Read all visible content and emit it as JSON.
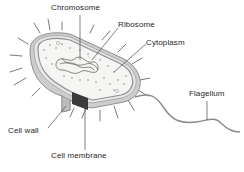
{
  "diagram": {
    "labels": {
      "chromosome": "Chromosome",
      "ribosome": "Ribosome",
      "cytoplasm": "Cytoplasm",
      "flagellum": "Flagellum",
      "cell_wall": "Cell wall",
      "cell_membrane": "Cell membrane"
    },
    "colors": {
      "wall": "#c8c8c8",
      "membrane": "#8a8a8a",
      "cytoplasm": "#f4f4f2",
      "leader": "#4a4a4a",
      "text": "#1f1f1f"
    }
  }
}
